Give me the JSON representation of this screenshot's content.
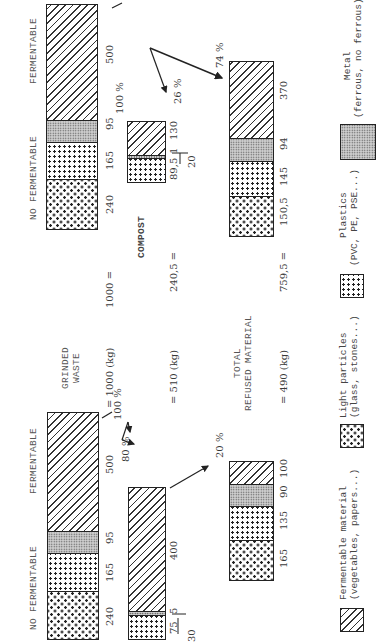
{
  "headers": {
    "no_fermentable": "NO FERMENTABLE",
    "fermentable": "FERMENTABLE"
  },
  "left": {
    "input_bar": {
      "segments": [
        {
          "material": "light_particles",
          "value": "240"
        },
        {
          "material": "plastics",
          "value": "165"
        },
        {
          "material": "metal",
          "value": "95"
        },
        {
          "material": "fermentable",
          "value": "500"
        }
      ],
      "percent": "100 %"
    },
    "grinded_title_1": "GRINDED",
    "grinded_title_2": "WASTE",
    "grinded_total": "= 1000 (kg)",
    "compost_bar": {
      "segments": [
        {
          "material": "plastics",
          "value": "75"
        },
        {
          "material": "metal",
          "value": "5"
        },
        {
          "material": "fermentable",
          "value": "400"
        }
      ],
      "percent": "80 %",
      "side_value": "30"
    },
    "compost_total": "= 510 (kg)",
    "refused_title_1": "TOTAL",
    "refused_title_2": "REFUSED MATERIAL",
    "refused_percent": "20 %",
    "refused_bar": {
      "segments": [
        {
          "material": "light_particles",
          "value": "165"
        },
        {
          "material": "plastics",
          "value": "135"
        },
        {
          "material": "metal",
          "value": "90"
        },
        {
          "material": "fermentable",
          "value": "100"
        }
      ]
    },
    "refused_total": "= 490 (kg)"
  },
  "right": {
    "input_bar": {
      "segments": [
        {
          "material": "light_particles",
          "value": "240"
        },
        {
          "material": "plastics",
          "value": "165"
        },
        {
          "material": "metal",
          "value": "95"
        },
        {
          "material": "fermentable",
          "value": "500"
        }
      ],
      "percent": "100 %"
    },
    "grinded_total": "1000 =",
    "compost_title": "COMPOST",
    "compost_bar": {
      "segments": [
        {
          "material": "plastics",
          "value": "89,5"
        },
        {
          "material": "metal",
          "value": "1"
        },
        {
          "material": "fermentable",
          "value": "130"
        }
      ],
      "percent": "26 %",
      "side_value": "20"
    },
    "compost_total": "240,5 =",
    "refused_percent": "74 %",
    "refused_bar": {
      "segments": [
        {
          "material": "light_particles",
          "value": "150,5"
        },
        {
          "material": "plastics",
          "value": "145"
        },
        {
          "material": "metal",
          "value": "94"
        },
        {
          "material": "fermentable",
          "value": "370"
        }
      ]
    },
    "refused_total": "759,5 ="
  },
  "legend": [
    {
      "pattern": "fermentable",
      "line1": "Fermentable material",
      "line2": "(vegetables, papers...)"
    },
    {
      "pattern": "light_particles",
      "line1": "Light particles",
      "line2": "(glass, stones...)"
    },
    {
      "pattern": "plastics",
      "line1": "Plastics",
      "line2": "(PVC, PE, PSE...)"
    },
    {
      "pattern": "metal",
      "line1": "Metal",
      "line2": "(ferrous, no ferrous)"
    }
  ]
}
